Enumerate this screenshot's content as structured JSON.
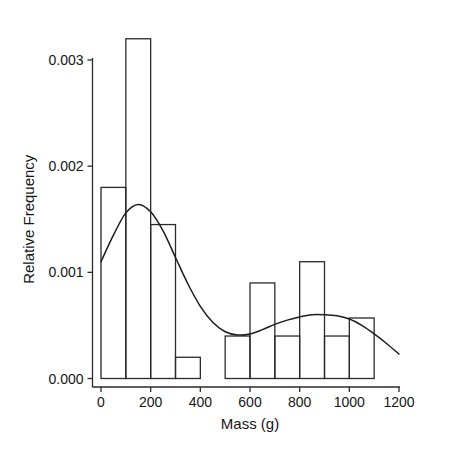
{
  "caption": {
    "text": "FIGURE 2 Mass of Laboratory Rats"
  },
  "chart_data": {
    "type": "bar",
    "title": "",
    "subtitle": "",
    "xlabel": "Mass (g)",
    "ylabel": "Relative Frequency",
    "xlim": [
      0,
      1200
    ],
    "ylim": [
      0,
      0.0035
    ],
    "grid": false,
    "legend": null,
    "xticks": [
      0,
      200,
      400,
      600,
      800,
      1000,
      1200
    ],
    "xtick_labels": [
      "0",
      "200",
      "400",
      "600",
      "800",
      "1000",
      "1200"
    ],
    "yticks": [
      0,
      0.001,
      0.002,
      0.003
    ],
    "ytick_labels": [
      "0.000",
      "0.001",
      "0.002",
      "0.003"
    ],
    "bin_width": 100,
    "bins": [
      {
        "x0": 0,
        "x1": 100,
        "value": 0.0018
      },
      {
        "x0": 100,
        "x1": 200,
        "value": 0.0032
      },
      {
        "x0": 200,
        "x1": 300,
        "value": 0.00145
      },
      {
        "x0": 300,
        "x1": 400,
        "value": 0.0002
      },
      {
        "x0": 400,
        "x1": 500,
        "value": 0.0
      },
      {
        "x0": 500,
        "x1": 600,
        "value": 0.0004
      },
      {
        "x0": 600,
        "x1": 700,
        "value": 0.0009
      },
      {
        "x0": 700,
        "x1": 800,
        "value": 0.0004
      },
      {
        "x0": 800,
        "x1": 900,
        "value": 0.0011
      },
      {
        "x0": 900,
        "x1": 1000,
        "value": 0.0004
      },
      {
        "x0": 1000,
        "x1": 1100,
        "value": 0.00057
      },
      {
        "x0": 1100,
        "x1": 1200,
        "value": 0.0
      }
    ],
    "categories": [
      "0-100",
      "100-200",
      "200-300",
      "300-400",
      "400-500",
      "500-600",
      "600-700",
      "700-800",
      "800-900",
      "900-1000",
      "1000-1100",
      "1100-1200"
    ],
    "values": [
      0.0018,
      0.0032,
      0.00145,
      0.0002,
      0.0,
      0.0004,
      0.0009,
      0.0004,
      0.0011,
      0.0004,
      0.00057,
      0.0
    ],
    "density_curve": {
      "name": "kernel density estimate",
      "x": [
        0,
        50,
        100,
        150,
        200,
        250,
        300,
        350,
        400,
        450,
        500,
        550,
        600,
        650,
        700,
        750,
        800,
        850,
        900,
        950,
        1000,
        1050,
        1100,
        1150,
        1200
      ],
      "y": [
        0.0011,
        0.00135,
        0.00156,
        0.00164,
        0.00157,
        0.00139,
        0.00114,
        0.00089,
        0.00068,
        0.00053,
        0.00044,
        0.00041,
        0.00042,
        0.00046,
        0.00051,
        0.00055,
        0.00058,
        0.0006,
        0.0006,
        0.00059,
        0.00056,
        0.0005,
        0.00042,
        0.00033,
        0.00023
      ]
    },
    "colors": {
      "bar_stroke": "#2a2a2a",
      "bar_fill": "none",
      "curve": "#1c1c1c",
      "axis": "#2a2a2a",
      "background": "#ffffff"
    }
  }
}
